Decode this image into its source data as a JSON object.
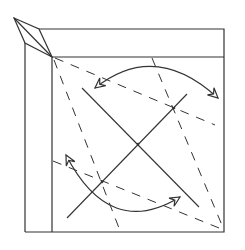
{
  "diagram": {
    "title": "Origami folding step: pleat corner with rotating folds",
    "type": "origami-crease-diagram",
    "colors": {
      "line": "#333333",
      "background": "#ffffff"
    },
    "outer_square": {
      "x1": 25,
      "y1": 29,
      "x2": 224,
      "y2": 232
    },
    "inner_square": {
      "x1": 52,
      "y1": 57,
      "x2": 224,
      "y2": 232
    },
    "corner_flap": {
      "points": "14,18 39,29 52,57 25,43",
      "center_crease": "14,18 52,57"
    },
    "solid_lines": [
      {
        "name": "diagonal-fold-1",
        "x1": 82,
        "y1": 88,
        "x2": 199,
        "y2": 207
      },
      {
        "name": "diagonal-fold-2",
        "x1": 67,
        "y1": 218,
        "x2": 187,
        "y2": 94
      }
    ],
    "dashed_lines": [
      {
        "name": "valley-fold-1",
        "x1": 54,
        "y1": 60,
        "x2": 119,
        "y2": 228
      },
      {
        "name": "valley-fold-2",
        "x1": 152,
        "y1": 58,
        "x2": 224,
        "y2": 230
      },
      {
        "name": "valley-fold-3",
        "x1": 55,
        "y1": 58,
        "x2": 215,
        "y2": 125
      },
      {
        "name": "valley-fold-4",
        "x1": 53,
        "y1": 161,
        "x2": 224,
        "y2": 230
      }
    ],
    "arrows": [
      {
        "name": "rotate-arrow-top",
        "path": "M95,88 Q155,40 218,98",
        "direction": "both"
      },
      {
        "name": "rotate-arrow-bottom",
        "path": "M66,155 Q110,240 180,197",
        "direction": "both"
      }
    ],
    "points": [
      {
        "name": "intersection-upper",
        "cx": 174,
        "cy": 108
      },
      {
        "name": "intersection-center",
        "cx": 138,
        "cy": 144
      },
      {
        "name": "intersection-lower",
        "cx": 102,
        "cy": 182
      }
    ]
  }
}
